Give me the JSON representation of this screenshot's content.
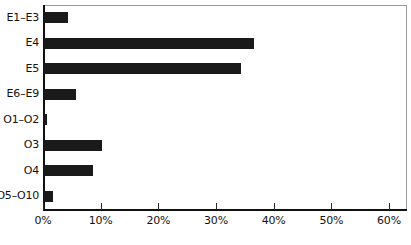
{
  "chart": {
    "type": "bar",
    "orientation": "horizontal",
    "title": "",
    "xlabel": "",
    "ylabel": "",
    "bar_color": "#1a1a1a",
    "axis_color": "#111111",
    "frame_color": "#9a9a9a",
    "background": "#ffffff",
    "grid": false,
    "legend": false
  },
  "chart_data": {
    "type": "bar",
    "orientation": "horizontal",
    "title": "",
    "xlabel": "",
    "ylabel": "",
    "grid": false,
    "legend": false,
    "xlim": [
      0,
      63
    ],
    "xticks": [
      0,
      10,
      20,
      30,
      40,
      50,
      60
    ],
    "xtick_labels": [
      "0%",
      "10%",
      "20%",
      "30%",
      "40%",
      "50%",
      "60%"
    ],
    "categories": [
      "E1–E3",
      "E4",
      "E5",
      "E6–E9",
      "O1–O2",
      "O3",
      "O4",
      "O5–O10"
    ],
    "values": [
      4.2,
      36.4,
      34.1,
      5.5,
      0.5,
      10.1,
      8.5,
      1.6
    ],
    "value_labels": [
      "4.2%",
      "36.4%",
      "34.1%",
      "5.5%",
      "0.5%",
      "10.1%",
      "8.5%",
      "1.6%"
    ],
    "series": [
      {
        "name": "",
        "values": [
          4.2,
          36.4,
          34.1,
          5.5,
          0.5,
          10.1,
          8.5,
          1.6
        ]
      }
    ]
  }
}
